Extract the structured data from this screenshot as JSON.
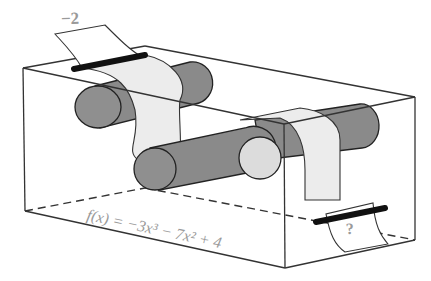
{
  "diagram": {
    "input_value": "−2",
    "output_value": "?",
    "function_label": "f(x) = −3x³ − 7x² + 4",
    "components": [
      "box",
      "input-slot",
      "output-slot",
      "rollers",
      "paper-strip"
    ],
    "colors": {
      "box_edge": "#333333",
      "roller": "#8a8a8a",
      "roller_light": "#dcdcdc",
      "paper": "#ececec",
      "label_text": "#9a9a9a",
      "slot": "#111111"
    }
  }
}
